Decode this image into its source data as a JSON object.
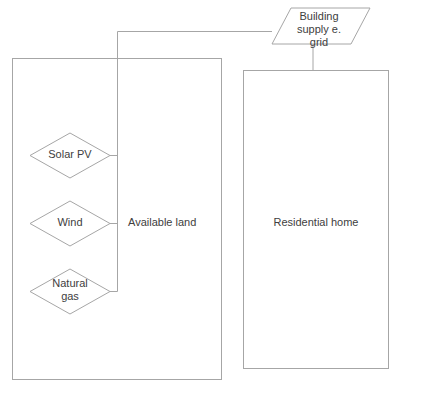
{
  "diagram": {
    "type": "block-flow-diagram",
    "colors": {
      "stroke": "#a6a6a6",
      "text": "#404040",
      "fill": "#ffffff",
      "background": "#ffffff"
    },
    "nodes": {
      "available_land": {
        "label": "Available land",
        "shape": "rectangle"
      },
      "residential_home": {
        "label": "Residential home",
        "shape": "rectangle"
      },
      "building_supply": {
        "label": "Building\nsupply e.\ngrid",
        "shape": "parallelogram"
      },
      "solar_pv": {
        "label": "Solar PV",
        "shape": "diamond"
      },
      "wind": {
        "label": "Wind",
        "shape": "diamond"
      },
      "natural_gas": {
        "label": "Natural\ngas",
        "shape": "diamond"
      }
    },
    "edges": [
      {
        "from": "solar_pv",
        "to": "building_supply"
      },
      {
        "from": "wind",
        "to": "building_supply"
      },
      {
        "from": "natural_gas",
        "to": "building_supply"
      },
      {
        "from": "building_supply",
        "to": "residential_home"
      }
    ]
  }
}
